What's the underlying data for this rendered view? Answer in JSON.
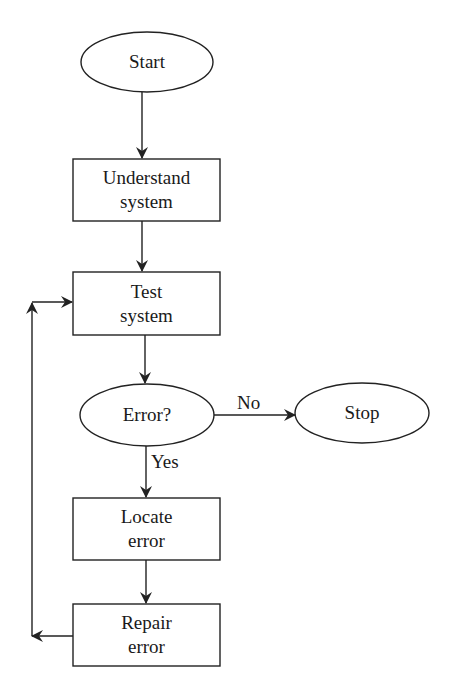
{
  "diagram": {
    "type": "flowchart",
    "colors": {
      "stroke": "#222222",
      "fill": "#ffffff",
      "text": "#1a1a1a"
    },
    "nodes": {
      "start": {
        "shape": "ellipse",
        "line1": "Start",
        "line2": ""
      },
      "understand": {
        "shape": "rect",
        "line1": "Understand",
        "line2": "system"
      },
      "test": {
        "shape": "rect",
        "line1": "Test",
        "line2": "system"
      },
      "error": {
        "shape": "ellipse",
        "line1": "Error?",
        "line2": ""
      },
      "stop": {
        "shape": "ellipse",
        "line1": "Stop",
        "line2": ""
      },
      "locate": {
        "shape": "rect",
        "line1": "Locate",
        "line2": "error"
      },
      "repair": {
        "shape": "rect",
        "line1": "Repair",
        "line2": "error"
      }
    },
    "edges": [
      {
        "from": "start",
        "to": "understand",
        "label": ""
      },
      {
        "from": "understand",
        "to": "test",
        "label": ""
      },
      {
        "from": "test",
        "to": "error",
        "label": ""
      },
      {
        "from": "error",
        "to": "stop",
        "label": "No"
      },
      {
        "from": "error",
        "to": "locate",
        "label": "Yes"
      },
      {
        "from": "locate",
        "to": "repair",
        "label": ""
      },
      {
        "from": "repair",
        "to": "test",
        "label": ""
      }
    ],
    "edge_labels": {
      "no": "No",
      "yes": "Yes"
    }
  }
}
